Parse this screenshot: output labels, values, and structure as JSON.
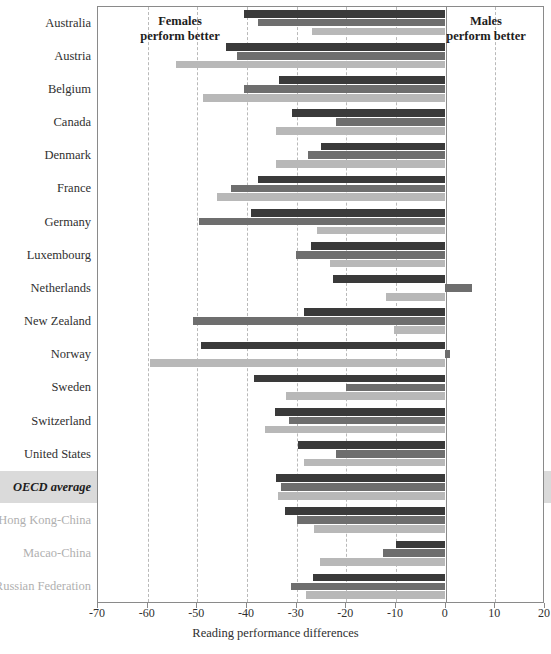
{
  "chart_data": {
    "type": "bar",
    "orientation": "horizontal",
    "title": "",
    "xlabel": "Reading performance differences",
    "ylabel": "",
    "xlim": [
      -70,
      20
    ],
    "xticks": [
      -70,
      -60,
      -50,
      -40,
      -30,
      -20,
      -10,
      0,
      10,
      20
    ],
    "xtick_labels": [
      "-70",
      "-60",
      "-50",
      "-40",
      "-30",
      "-20",
      "-10",
      "0",
      "10",
      "20"
    ],
    "grid": true,
    "legend": "none",
    "annotations": [
      {
        "name": "females-note",
        "text": "Females\nperform better",
        "line1": "Females",
        "line2": "perform better"
      },
      {
        "name": "males-note",
        "text": "Males\nperform better",
        "line1": "Males",
        "line2": "perform better"
      }
    ],
    "colors": {
      "series0": "#3a3a3a",
      "series1": "#6e6e6e",
      "series2": "#b8b8b8",
      "highlight": "#d3d3d3",
      "grid": "#b9b9b9",
      "axis": "#8a8a8a"
    },
    "categories": [
      "Australia",
      "Austria",
      "Belgium",
      "Canada",
      "Denmark",
      "France",
      "Germany",
      "Luxembourg",
      "Netherlands",
      "New Zealand",
      "Norway",
      "Sweden",
      "Switzerland",
      "United States",
      "OECD average",
      "Hong Kong-China",
      "Macao-China",
      "Russian Federation"
    ],
    "category_styles": [
      "normal",
      "normal",
      "normal",
      "normal",
      "normal",
      "normal",
      "normal",
      "normal",
      "normal",
      "normal",
      "normal",
      "normal",
      "normal",
      "normal",
      "oecd",
      "muted",
      "muted",
      "muted"
    ],
    "series": [
      {
        "name": "series-1",
        "values": [
          -40.4,
          -44.0,
          -33.4,
          -30.8,
          -25.0,
          -37.6,
          -39.0,
          -27.0,
          -22.4,
          -28.4,
          -49.0,
          -38.4,
          -34.2,
          -29.6,
          -34.0,
          -32.2,
          -9.8,
          -26.6
        ]
      },
      {
        "name": "series-2",
        "values": [
          -37.6,
          -41.8,
          -40.4,
          -21.8,
          -27.6,
          -43.0,
          -49.4,
          -30.0,
          5.6,
          -50.6,
          1.0,
          -19.8,
          -31.4,
          -21.8,
          -33.0,
          -29.8,
          -12.4,
          -31.0
        ]
      },
      {
        "name": "series-3",
        "values": [
          -26.8,
          -54.0,
          -48.6,
          -34.0,
          -34.0,
          -45.8,
          -25.8,
          -23.0,
          -11.8,
          -10.2,
          -59.4,
          -32.0,
          -36.2,
          -28.4,
          -33.6,
          -26.4,
          -25.2,
          -28.0
        ]
      }
    ]
  }
}
